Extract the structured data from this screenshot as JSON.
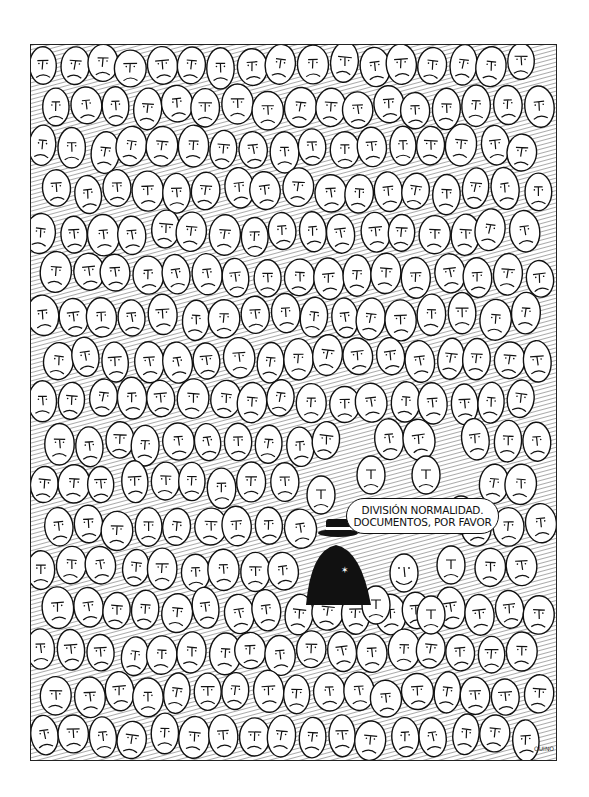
{
  "cartoon": {
    "speech_bubble": {
      "line1": "DIVISIÓN NORMALIDAD.",
      "line2": "DOCUMENTOS, POR FAVOR"
    },
    "scene": {
      "crowd_expression": "frowning",
      "odd_one_out_expression": "smiling",
      "inspector": "man in hat and dark coat with badge"
    },
    "signature": "QUINO"
  },
  "colors": {
    "ink": "#111111",
    "paper": "#ffffff",
    "hatch": "#555555"
  }
}
